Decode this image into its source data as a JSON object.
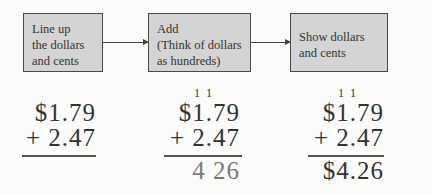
{
  "flow": {
    "steps": [
      {
        "lines": [
          "Line up",
          "the dollars",
          "and cents"
        ]
      },
      {
        "lines": [
          "Add",
          "(Think of dollars",
          "as hundreds)"
        ]
      },
      {
        "lines": [
          "Show dollars",
          "and cents"
        ]
      }
    ]
  },
  "problems": [
    {
      "carry": "",
      "top": "$1.79",
      "bottom": "+ 2.47",
      "result": ""
    },
    {
      "carry": "1  1",
      "top": "$1.79",
      "bottom": "+ 2.47",
      "result": "4 26"
    },
    {
      "carry": "1  1",
      "top": "$1.79",
      "bottom": "+ 2.47",
      "result": "$4.26"
    }
  ]
}
